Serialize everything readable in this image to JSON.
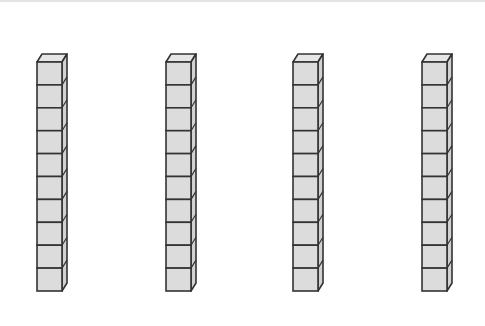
{
  "diagram": {
    "rod_count": 4,
    "cubes_per_rod": 10,
    "colors": {
      "fill": "#dcdcdc",
      "side": "#d2d2d2",
      "top": "#e6e6e6",
      "stroke": "#333333"
    },
    "rods": [
      {
        "x": 37,
        "y": 62
      },
      {
        "x": 166,
        "y": 62
      },
      {
        "x": 293,
        "y": 62
      },
      {
        "x": 422,
        "y": 62
      }
    ],
    "cube": {
      "width": 25,
      "height": 22.9,
      "depth_x": 5,
      "depth_y": 8
    }
  }
}
